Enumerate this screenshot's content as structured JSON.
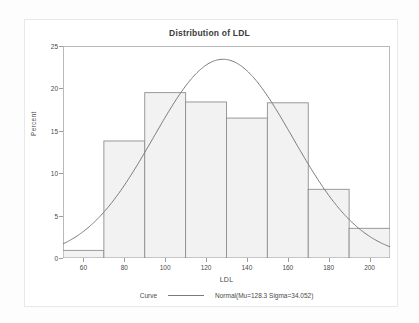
{
  "chart_data": {
    "type": "bar",
    "title": "Distribution of LDL",
    "xlabel": "LDL",
    "ylabel": "Percent",
    "xlim": [
      50,
      210
    ],
    "ylim": [
      0,
      25
    ],
    "xticks": [
      60,
      80,
      100,
      120,
      140,
      160,
      180,
      200
    ],
    "yticks": [
      0,
      5,
      10,
      15,
      20,
      25
    ],
    "grid": false,
    "legend_position": "bottom-center",
    "bin_width": 20,
    "bin_edges": [
      50,
      70,
      90,
      110,
      130,
      150,
      170,
      190,
      210
    ],
    "categories": [
      "50-70",
      "70-90",
      "90-110",
      "110-130",
      "130-150",
      "150-170",
      "170-190",
      "190-210"
    ],
    "values": [
      0.9,
      13.8,
      19.5,
      18.4,
      16.5,
      18.3,
      8.1,
      3.5
    ],
    "overlay": {
      "type": "line",
      "name": "Normal",
      "mu": 128.3,
      "sigma": 34.052,
      "scale_bin_width": 20,
      "peak_percent": 23.3
    },
    "legend": {
      "title": "Curve",
      "entries": [
        {
          "marker": "line",
          "label": "Normal(Mu=128.3 Sigma=34.052)",
          "color": "#7a7a7a"
        }
      ]
    },
    "colors": {
      "bar_fill": "#f2f2f2",
      "bar_stroke": "#8f8f8f",
      "curve": "#7a7a7a",
      "axis": "#b9b9b9",
      "text": "#4a4a4a"
    }
  }
}
